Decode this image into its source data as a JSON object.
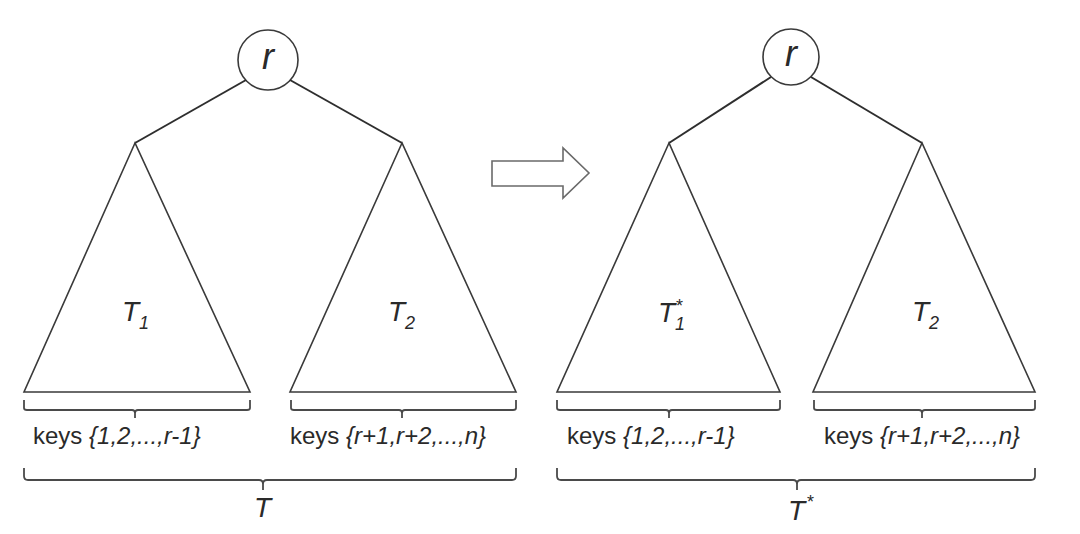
{
  "left_diagram": {
    "root_label": "r",
    "left_subtree_name": "T",
    "left_subtree_sub": "1",
    "right_subtree_name": "T",
    "right_subtree_sub": "2",
    "left_keys_prefix": "keys ",
    "left_keys_set": "{1,2,...,r-1}",
    "right_keys_prefix": "keys ",
    "right_keys_set": "{r+1,r+2,...,n}",
    "whole_tree_label": "T"
  },
  "arrow": {
    "direction": "right",
    "meaning": "transforms-to"
  },
  "right_diagram": {
    "root_label": "r",
    "left_subtree_name": "T",
    "left_subtree_sub": "1",
    "left_subtree_sup": "*",
    "right_subtree_name": "T",
    "right_subtree_sub": "2",
    "left_keys_prefix": "keys ",
    "left_keys_set": "{1,2,...,r-1}",
    "right_keys_prefix": "keys ",
    "right_keys_set": "{r+1,r+2,...,n}",
    "whole_tree_label": "T",
    "whole_tree_sup": "*"
  },
  "colors": {
    "stroke": "#3a3a3a",
    "text": "#2a2a2a",
    "background": "#ffffff"
  }
}
